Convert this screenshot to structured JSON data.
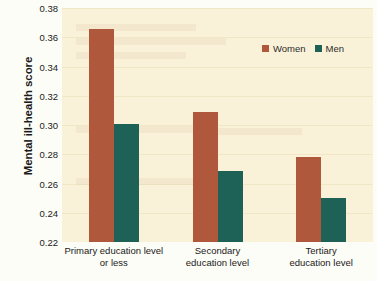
{
  "chart_data": {
    "type": "bar",
    "title": "",
    "subtitle": "",
    "xlabel": "",
    "ylabel": "Mental ill-health score",
    "ylim": [
      0.22,
      0.38
    ],
    "ytick_step": 0.02,
    "yticks": [
      "0.38",
      "0.36",
      "0.34",
      "0.32",
      "0.30",
      "0.28",
      "0.26",
      "0.24",
      "0.22"
    ],
    "ytick_values": [
      0.38,
      0.36,
      0.34,
      0.32,
      0.3,
      0.28,
      0.26,
      0.24,
      0.22
    ],
    "grid": true,
    "legend_position": "top-right",
    "categories": [
      "Primary education level or less",
      "Secondary education level",
      "Tertiary education level"
    ],
    "category_lines": [
      [
        "Primary education level",
        "or less"
      ],
      [
        "Secondary",
        "education level"
      ],
      [
        "Tertiary",
        "education level"
      ]
    ],
    "series": [
      {
        "name": "Women",
        "color": "#b0583c",
        "values": [
          0.3655,
          0.309,
          0.278
        ]
      },
      {
        "name": "Men",
        "color": "#1d6157",
        "values": [
          0.3005,
          0.2685,
          0.25
        ]
      }
    ],
    "colors": {
      "women": "#b0583c",
      "men": "#1d6157",
      "plot_background": "#faf2d8",
      "gridline": "#f1e7c6",
      "page_background": "#fdfdf7",
      "text": "#1a1a1a"
    }
  },
  "legend": {
    "entries": [
      {
        "label": "Women",
        "color": "#b0583c"
      },
      {
        "label": "Men",
        "color": "#1d6157"
      }
    ]
  },
  "axes": {
    "y_title": "Mental ill-health score"
  },
  "ghost_text": {
    "lines": [
      "a",
      "a",
      "a",
      "a",
      "a",
      "a"
    ]
  }
}
